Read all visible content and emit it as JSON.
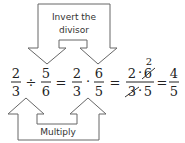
{
  "top_label": {
    "line1": "Invert the",
    "line2": "divisor"
  },
  "bottom_label": "Multiply",
  "equation": {
    "f1": {
      "num": "2",
      "den": "3"
    },
    "op1": "÷",
    "f2": {
      "num": "5",
      "den": "6"
    },
    "eq1": "=",
    "f3": {
      "num": "2",
      "den": "3"
    },
    "op2": "·",
    "f4": {
      "num": "6",
      "den": "5"
    },
    "eq2": "=",
    "f5": {
      "num_a": "2",
      "dot": "·",
      "num_b": "6",
      "num_b_reduced": "2",
      "den_a": "3",
      "den_b": "5"
    },
    "eq3": "=",
    "f6": {
      "num": "4",
      "den": "5"
    }
  },
  "colors": {
    "arrow_stroke": "#666666",
    "text": "#222222"
  }
}
